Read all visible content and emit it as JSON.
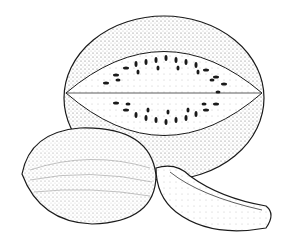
{
  "image": {
    "description": "Stippled pen-and-ink illustration of watermelons: a halved watermelon showing seeds, a whole oval melon, and a wedge slice",
    "colors": {
      "background": "#ffffff",
      "ink": "#1a1a1a",
      "stipple": "#555555"
    },
    "objects": [
      {
        "name": "halved-watermelon",
        "seed_count": 36
      },
      {
        "name": "whole-melon"
      },
      {
        "name": "melon-wedge"
      }
    ]
  }
}
